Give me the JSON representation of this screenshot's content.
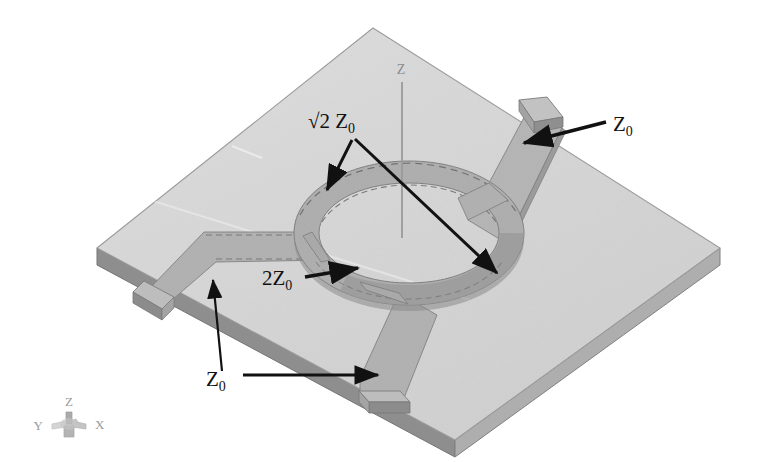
{
  "figure": {
    "kind": "3d-cad-view",
    "background_color": "#ffffff"
  },
  "colors": {
    "substrate_top": "#d6d6d6",
    "substrate_top_light": "#dcdcdc",
    "substrate_side_front": "#8e8e8e",
    "substrate_side_right": "#a8a8a8",
    "substrate_outline": "#8a8a8a",
    "trace_top": "#b3b3b3",
    "trace_top_shaded": "#a6a6a6",
    "trace_edge": "#7a7a7a",
    "trace_dash": "#6f6f6f",
    "port_block_top": "#c0c0c0",
    "port_block_front": "#8f8f8f",
    "port_block_side": "#9f9f9f",
    "annotation": "#111111",
    "axis_line": "#9a9a9a",
    "axis_text": "#8d8d8d",
    "triad_text": "#9a9a9a"
  },
  "annotations": [
    {
      "id": "sqrt2-z0",
      "text_main": "√2 Z",
      "text_sub": "0",
      "full": "√2 Z₀",
      "x": 308,
      "y": 122,
      "meaning": "ring-arm characteristic impedance",
      "arrow_count": 2
    },
    {
      "id": "two-z0",
      "text_main": "2Z",
      "text_sub": "0",
      "full": "2Z₀",
      "x": 262,
      "y": 281,
      "meaning": "ring quarter-wave section impedance",
      "arrow_count": 1
    },
    {
      "id": "z0-top-right",
      "text_main": "Z",
      "text_sub": "0",
      "full": "Z₀",
      "x": 613,
      "y": 127,
      "meaning": "port feedline impedance",
      "arrow_count": 1
    },
    {
      "id": "z0-bottom-left",
      "text_main": "Z",
      "text_sub": "0",
      "full": "Z₀",
      "x": 215,
      "y": 382,
      "meaning": "port feedline impedance",
      "arrow_count": 2
    }
  ],
  "axis_indicator": {
    "label": "Z",
    "label_x": 401,
    "label_y": 74,
    "line_from_y": 80,
    "line_to_y": 238
  },
  "triad": {
    "z_label": "Z",
    "x_label": "X",
    "y_label": "Y",
    "origin_x": 69,
    "origin_y": 425
  },
  "ports": [
    {
      "id": "port-top-right",
      "edge": "upper-right",
      "label": "Z₀"
    },
    {
      "id": "port-left",
      "edge": "lower-left",
      "label": "Z₀"
    },
    {
      "id": "port-bottom",
      "edge": "lower-right",
      "label": "Z₀"
    }
  ]
}
